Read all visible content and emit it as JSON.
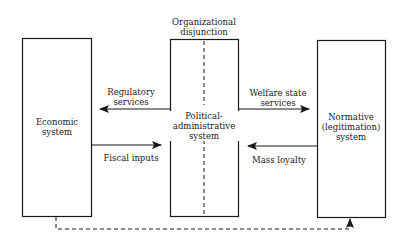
{
  "diagram": {
    "colors": {
      "stroke": "#1a1a1a",
      "background": "#ffffff"
    },
    "boxes": [
      {
        "id": "economic",
        "label_lines": [
          "Economic",
          "system"
        ]
      },
      {
        "id": "political",
        "label_lines": [
          "Political-",
          "administrative",
          "system"
        ]
      },
      {
        "id": "normative",
        "label_lines": [
          "Normative",
          "(legitimation)",
          "system"
        ]
      }
    ],
    "top_label": {
      "lines": [
        "Organizational",
        "disjunction"
      ]
    },
    "arrows": [
      {
        "from": "political",
        "to": "economic",
        "label_lines": [
          "Regulatory",
          "services"
        ]
      },
      {
        "from": "economic",
        "to": "political",
        "label_lines": [
          "Fiscal inputs"
        ]
      },
      {
        "from": "political",
        "to": "normative",
        "label_lines": [
          "Welfare state",
          "services"
        ]
      },
      {
        "from": "normative",
        "to": "political",
        "label_lines": [
          "Mass loyalty"
        ]
      },
      {
        "from": "economic",
        "to": "normative",
        "style": "dashed",
        "label_lines": []
      }
    ]
  }
}
